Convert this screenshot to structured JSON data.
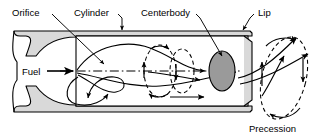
{
  "figure": {
    "name": "precessing-jet-nozzle-schematic",
    "labels": {
      "orifice": "Orifice",
      "cylinder": "Cylinder",
      "centerbody": "Centerbody",
      "lip": "Lip",
      "fuel": "Fuel",
      "precession": "Precession"
    },
    "colors": {
      "line": "#000000",
      "wall_fill": "#d9d9d9",
      "centerbody_fill": "#9a9a9a",
      "chamber_fill": "#ffffff",
      "background": "#ffffff"
    },
    "parts": [
      {
        "id": "inlet-plenum",
        "label": "Fuel",
        "shape": "converging-duct"
      },
      {
        "id": "orifice-throat",
        "label": "Orifice",
        "shape": "throat"
      },
      {
        "id": "cylinder-chamber",
        "label": "Cylinder",
        "shape": "rectangular-duct"
      },
      {
        "id": "centerbody",
        "label": "Centerbody",
        "shape": "ellipse"
      },
      {
        "id": "exit-lip",
        "label": "Lip",
        "shape": "chamfered-edge"
      },
      {
        "id": "precessing-jet",
        "label": "Precession",
        "shape": "helical-jet"
      }
    ],
    "flow_features": [
      {
        "id": "centerline",
        "style": "dash-dot"
      },
      {
        "id": "fuel-inlet-arrow",
        "direction": "right"
      },
      {
        "id": "recirculation-vortex-upper",
        "direction": "clockwise"
      },
      {
        "id": "recirculation-vortex-lower",
        "direction": "counterclockwise"
      },
      {
        "id": "vortex-ring-mid",
        "style": "dashed-ellipse"
      },
      {
        "id": "vortex-ring-centerbody",
        "style": "dashed-ellipse"
      },
      {
        "id": "precession-orbit",
        "style": "dashed-ellipse"
      }
    ]
  }
}
